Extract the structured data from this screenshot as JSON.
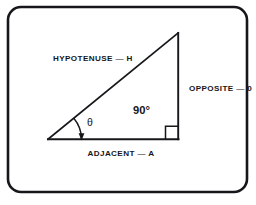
{
  "figure": {
    "name": "right-triangle-trigonometry-diagram",
    "background_color": "#ffffff",
    "ink_color": "#17161a",
    "frame": {
      "name": "rounded-border-frame",
      "x": 8,
      "y": 7,
      "width": 239,
      "height": 185,
      "corner_radius": 13,
      "stroke_width": 2.6
    },
    "triangle": {
      "vertices": {
        "left": [
          48,
          139
        ],
        "apex": [
          178,
          33
        ],
        "bottom_right": [
          178.5,
          139
        ]
      },
      "stroke_width": 1.7
    },
    "right_angle_marker": {
      "size": 13,
      "stroke_width": 1.5
    },
    "theta_arc": {
      "radius": 33,
      "stroke_width": 1.4,
      "arrowhead": true
    }
  },
  "labels": {
    "hypotenuse": "HYPOTENUSE — H",
    "opposite": "OPPOSITE — 0",
    "adjacent": "ADJACENT — A",
    "right_angle": "90°",
    "theta": "θ"
  }
}
